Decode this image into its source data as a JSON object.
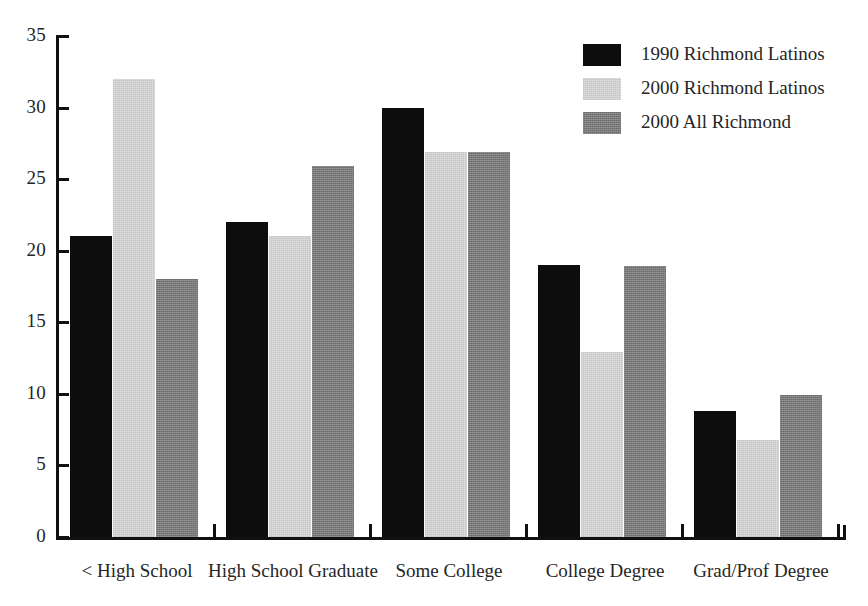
{
  "chart_data": {
    "type": "bar",
    "title": "",
    "subtitle": "",
    "xlabel": "",
    "ylabel": "",
    "ylim": [
      0,
      35
    ],
    "yticks": [
      0,
      5,
      10,
      15,
      20,
      25,
      30,
      35
    ],
    "grid": false,
    "legend_position": "top-right",
    "categories": [
      "< High School",
      "High School Graduate",
      "Some College",
      "College Degree",
      "Grad/Prof Degree"
    ],
    "series": [
      {
        "name": "1990 Richmond Latinos",
        "color": "#0d0d0d",
        "swatch": "swatch-black",
        "values": [
          21,
          22,
          30,
          19,
          8.8
        ]
      },
      {
        "name": "2000 Richmond Latinos",
        "color": "#dedede",
        "swatch": "swatch-light",
        "values": [
          32,
          21,
          26.9,
          12.9,
          6.8
        ]
      },
      {
        "name": "2000 All Richmond",
        "color": "#7f7f7f",
        "swatch": "swatch-dark",
        "values": [
          18,
          25.9,
          26.9,
          18.9,
          9.9
        ]
      }
    ]
  },
  "axis": {
    "y_tick_labels": [
      "35",
      "30",
      "25",
      "20",
      "15",
      "10",
      "5",
      "0"
    ]
  },
  "legend": {
    "entries": [
      {
        "label": "1990 Richmond Latinos"
      },
      {
        "label": "2000 Richmond Latinos"
      },
      {
        "label": "2000 All Richmond"
      }
    ]
  }
}
